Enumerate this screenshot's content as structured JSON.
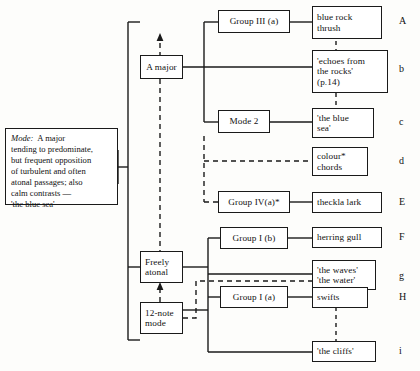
{
  "diagram": {
    "note_box": {
      "name": "mode-note",
      "label_italic": "Mode:",
      "lines": [
        "Mode:  A major",
        "tending to predominate,",
        "but frequent opposition",
        "of turbulent and often",
        "atonal passages; also",
        "calm contrasts —",
        "'the blue sea'"
      ]
    },
    "tonality_boxes": [
      {
        "id": "a-major",
        "lines": [
          "A major"
        ]
      },
      {
        "id": "freely-atonal",
        "lines": [
          "Freely",
          "atonal"
        ]
      },
      {
        "id": "twelve-note",
        "lines": [
          "12-note",
          "mode"
        ]
      }
    ],
    "group_boxes": [
      {
        "id": "group-3a",
        "lines": [
          "Group III (a)"
        ]
      },
      {
        "id": "mode-2",
        "lines": [
          "Mode 2"
        ]
      },
      {
        "id": "group-4a",
        "lines": [
          "Group IV(a)*"
        ]
      },
      {
        "id": "group-1b",
        "lines": [
          "Group I (b)"
        ]
      },
      {
        "id": "group-1a",
        "lines": [
          "Group I (a)"
        ]
      }
    ],
    "subject_boxes": [
      {
        "id": "blue-rock-thrush",
        "lines": [
          "blue rock",
          "thrush"
        ]
      },
      {
        "id": "echoes-rocks",
        "lines": [
          "'echoes from",
          "the rocks'",
          "(p.14)"
        ]
      },
      {
        "id": "the-blue-sea",
        "lines": [
          "'the blue",
          "sea'"
        ]
      },
      {
        "id": "colour-chords",
        "lines": [
          "colour*",
          "chords"
        ]
      },
      {
        "id": "thekla-lark",
        "lines": [
          "theckla lark"
        ]
      },
      {
        "id": "herring-gull",
        "lines": [
          "herring gull"
        ]
      },
      {
        "id": "waves-water",
        "lines": [
          "'the waves'",
          "'the water'"
        ]
      },
      {
        "id": "swifts",
        "lines": [
          "swifts"
        ]
      },
      {
        "id": "the-cliffs",
        "lines": [
          "'the cliffs'"
        ]
      }
    ],
    "row_labels": [
      "A",
      "b",
      "c",
      "d",
      "E",
      "F",
      "g",
      "H",
      "i"
    ],
    "colors": {
      "stroke": "#1a1a1a",
      "page": "#fdfdfb",
      "box_fill": "#ffffff",
      "text": "#111111"
    }
  }
}
